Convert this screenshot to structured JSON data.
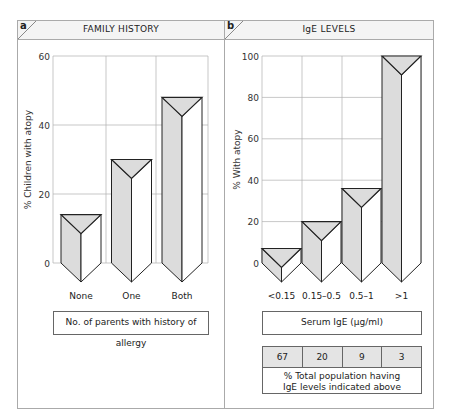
{
  "panels": {
    "a": {
      "letter": "a",
      "title": "FAMILY HISTORY",
      "caption": "No. of parents with history of allergy"
    },
    "b": {
      "letter": "b",
      "title": "IgE LEVELS",
      "caption": "Serum IgE (µg/ml)",
      "population_table": {
        "values": [
          "67",
          "20",
          "9",
          "3"
        ],
        "note_line1": "% Total population having",
        "note_line2": "IgE levels indicated above"
      }
    }
  },
  "colors": {
    "bar_shade": "#dcdcdc",
    "bar_light": "#ffffff",
    "outline": "#222222",
    "grid": "#b0b0b0",
    "border": "#aaaaaa"
  },
  "chart_data": [
    {
      "type": "bar",
      "title": "FAMILY HISTORY",
      "xlabel": "No. of parents with history of allergy",
      "ylabel": "% Children with atopy",
      "categories": [
        "None",
        "One",
        "Both"
      ],
      "values": [
        14,
        30,
        48
      ],
      "ylim": [
        0,
        60
      ],
      "yticks": [
        0,
        20,
        40,
        60
      ],
      "grid": true,
      "style": "3d-prism"
    },
    {
      "type": "bar",
      "title": "IgE LEVELS",
      "xlabel": "Serum IgE (µg/ml)",
      "ylabel": "% With atopy",
      "categories": [
        "<0.15",
        "0.15–0.5",
        "0.5–1",
        ">1"
      ],
      "values": [
        7,
        20,
        36,
        100
      ],
      "ylim": [
        0,
        100
      ],
      "yticks": [
        0,
        20,
        40,
        60,
        80,
        100
      ],
      "grid": true,
      "style": "3d-prism",
      "population_percent": [
        67,
        20,
        9,
        3
      ]
    }
  ]
}
